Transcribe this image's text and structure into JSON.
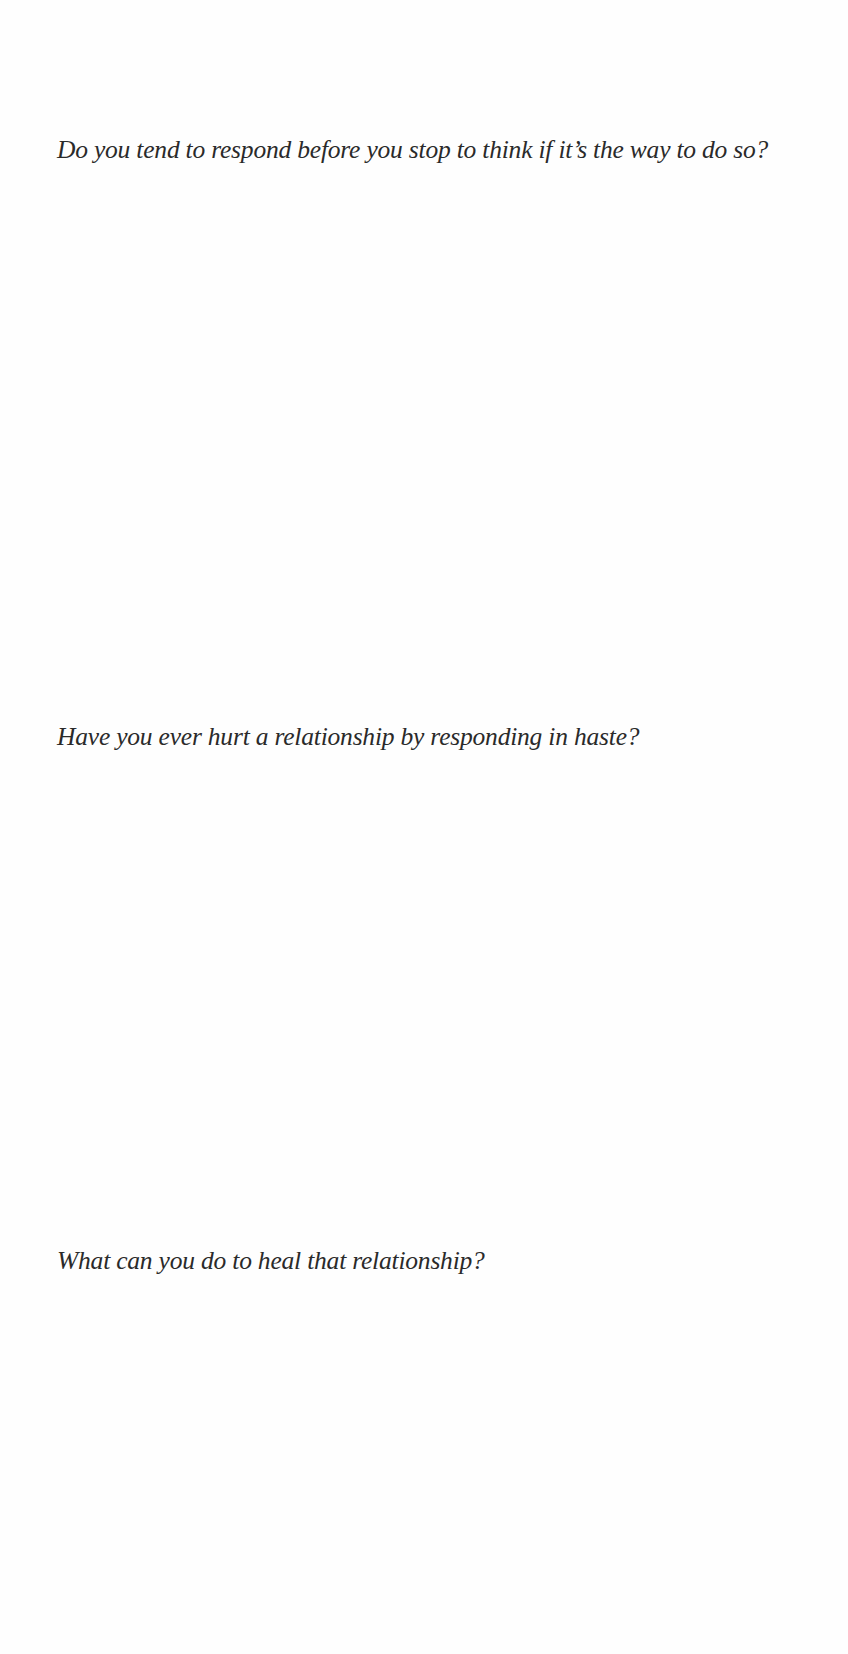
{
  "worksheet": {
    "questions": [
      {
        "text": "Do you tend to respond before you stop to think if it’s the way to do so?"
      },
      {
        "text": "Have you ever hurt a relationship by responding in haste?"
      },
      {
        "text": "What can you do to heal that relationship?"
      }
    ]
  }
}
